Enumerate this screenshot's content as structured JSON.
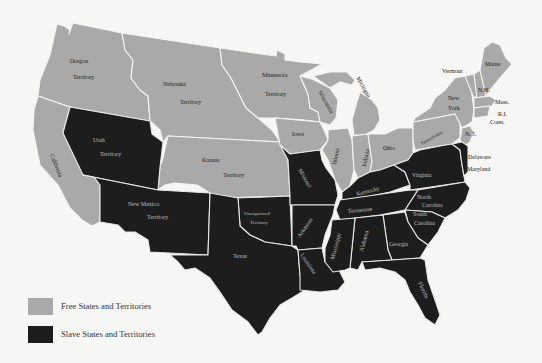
{
  "map": {
    "colors": {
      "free": "#a9a9a9",
      "slave": "#1d1d1d",
      "background": "#f6f6f4",
      "border": "#f4f4f2"
    },
    "regions": {
      "oregon_territory": {
        "status": "free",
        "line1": "Oregon",
        "line2": "Territory"
      },
      "nebraska_territory": {
        "status": "free",
        "line1": "Nebraska",
        "line2": "Territory"
      },
      "minnesota_territory": {
        "status": "free",
        "line1": "Minnesota",
        "line2": "Territory"
      },
      "california": {
        "status": "free",
        "label": "California"
      },
      "utah_territory": {
        "status": "slave",
        "line1": "Utah",
        "line2": "Territory"
      },
      "kansas_territory": {
        "status": "free",
        "line1": "Kansas",
        "line2": "Territory"
      },
      "new_mexico_territory": {
        "status": "slave",
        "line1": "New Mexico",
        "line2": "Territory"
      },
      "unorganized_territory": {
        "status": "slave",
        "line1": "Unorganized",
        "line2": "Territory"
      },
      "texas": {
        "status": "slave",
        "label": "Texas"
      },
      "iowa": {
        "status": "free",
        "label": "Iowa"
      },
      "wisconsin": {
        "status": "free",
        "label": "Wisconsin"
      },
      "michigan": {
        "status": "free",
        "label": "Michigan"
      },
      "illinois": {
        "status": "free",
        "label": "Illinois"
      },
      "indiana": {
        "status": "free",
        "label": "Indiana"
      },
      "ohio": {
        "status": "free",
        "label": "Ohio"
      },
      "pennsylvania": {
        "status": "free",
        "label": "Pennsylvania"
      },
      "new_york": {
        "status": "free",
        "line1": "New",
        "line2": "York"
      },
      "vermont": {
        "status": "free",
        "label": "Vermont"
      },
      "new_hampshire": {
        "status": "free",
        "label": "N.H."
      },
      "maine": {
        "status": "free",
        "label": "Maine"
      },
      "massachusetts": {
        "status": "free",
        "label": "Mass."
      },
      "rhode_island": {
        "status": "free",
        "label": "R.I."
      },
      "connecticut": {
        "status": "free",
        "label": "Conn."
      },
      "new_jersey": {
        "status": "free",
        "label": "N. J."
      },
      "delaware": {
        "status": "slave",
        "label": "Delaware"
      },
      "maryland": {
        "status": "slave",
        "label": "Maryland"
      },
      "missouri": {
        "status": "slave",
        "label": "Missouri"
      },
      "arkansas": {
        "status": "slave",
        "label": "Arkansas"
      },
      "louisiana": {
        "status": "slave",
        "label": "Louisiana"
      },
      "kentucky": {
        "status": "slave",
        "label": "Kentucky"
      },
      "tennessee": {
        "status": "slave",
        "label": "Tennessee"
      },
      "virginia": {
        "status": "slave",
        "label": "Virginia"
      },
      "north_carolina": {
        "status": "slave",
        "line1": "North",
        "line2": "Carolina"
      },
      "south_carolina": {
        "status": "slave",
        "line1": "South",
        "line2": "Carolina"
      },
      "georgia": {
        "status": "slave",
        "label": "Georgia"
      },
      "alabama": {
        "status": "slave",
        "label": "Alabama"
      },
      "mississippi": {
        "status": "slave",
        "label": "Mississippi"
      },
      "florida": {
        "status": "slave",
        "label": "Florida"
      }
    }
  },
  "legend": {
    "items": [
      {
        "label": "Free States and Territories",
        "color": "#a9a9a9"
      },
      {
        "label": "Slave States and Territories",
        "color": "#1d1d1d"
      }
    ]
  }
}
